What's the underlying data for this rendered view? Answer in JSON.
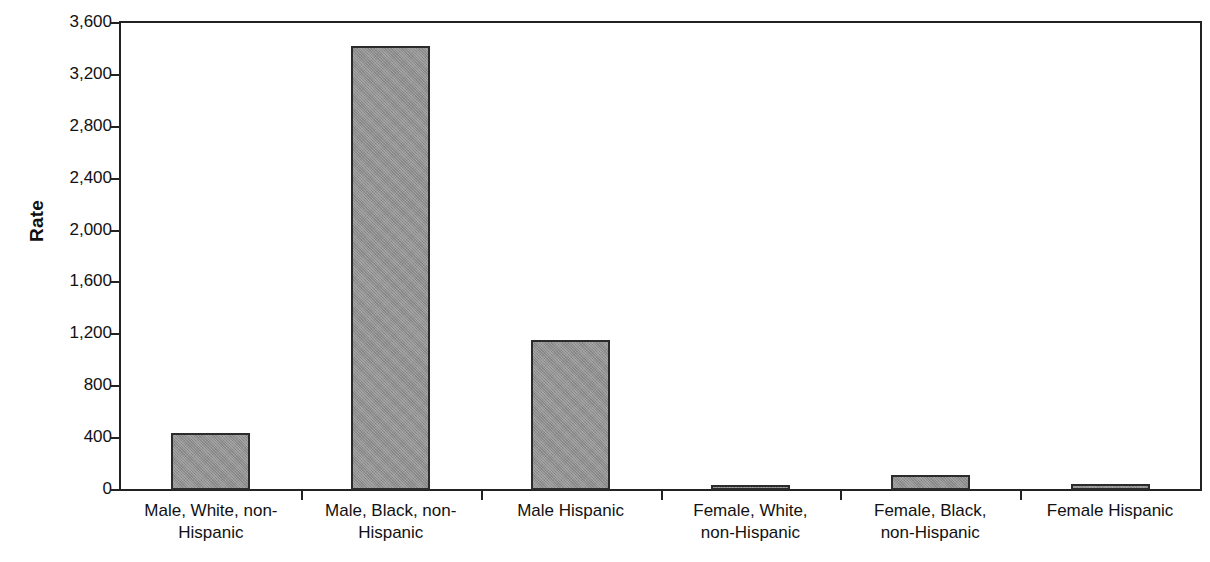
{
  "chart_data": {
    "type": "bar",
    "title": "",
    "xlabel": "",
    "ylabel": "Rate",
    "ylim": [
      0,
      3600
    ],
    "ytick_step": 400,
    "grid": false,
    "legend": null,
    "bar_color": "#8f8f8f",
    "bar_border_color": "#2b2b2b",
    "axis_color": "#222222",
    "categories": [
      "Male, White, non-Hispanic",
      "Male, Black, non-Hispanic",
      "Male Hispanic",
      "Female, White, non-Hispanic",
      "Female, Black, non-Hispanic",
      "Female Hispanic"
    ],
    "values": [
      440,
      3420,
      1160,
      40,
      115,
      45
    ],
    "ytick_labels": [
      "0",
      "400",
      "800",
      "1,200",
      "1,600",
      "2,000",
      "2,400",
      "2,800",
      "3,200",
      "3,600"
    ],
    "ytick_values": [
      0,
      400,
      800,
      1200,
      1600,
      2000,
      2400,
      2800,
      3200,
      3600
    ]
  },
  "axis": {
    "y_title": "Rate"
  },
  "x_category_lines": [
    [
      "Male, White, non-",
      "Hispanic"
    ],
    [
      "Male, Black, non-",
      "Hispanic"
    ],
    [
      "Male Hispanic"
    ],
    [
      "Female, White,",
      "non-Hispanic"
    ],
    [
      "Female, Black,",
      "non-Hispanic"
    ],
    [
      "Female Hispanic"
    ]
  ]
}
